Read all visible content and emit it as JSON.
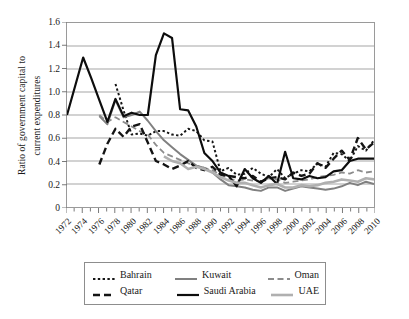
{
  "chart_data": {
    "type": "line",
    "title": "",
    "xlabel": "",
    "ylabel_line1": "Ratio of government capital to",
    "ylabel_line2": "current expenditures",
    "ylim": [
      0,
      1.6
    ],
    "ytick_labels": [
      "1.6",
      "1.4",
      "1.2",
      "1.0",
      "0.8",
      "0.6",
      "0.4",
      "0.2",
      "0"
    ],
    "ytick_values": [
      1.6,
      1.4,
      1.2,
      1.0,
      0.8,
      0.6,
      0.4,
      0.2,
      0
    ],
    "grid": true,
    "legend_position": "bottom",
    "xlim": [
      1972,
      2010
    ],
    "x": [
      1972,
      1973,
      1974,
      1975,
      1976,
      1977,
      1978,
      1979,
      1980,
      1981,
      1982,
      1983,
      1984,
      1985,
      1986,
      1987,
      1988,
      1989,
      1990,
      1991,
      1992,
      1993,
      1994,
      1995,
      1996,
      1997,
      1998,
      1999,
      2000,
      2001,
      2002,
      2003,
      2004,
      2005,
      2006,
      2007,
      2008,
      2009,
      2010
    ],
    "xtick_labels": [
      "1972",
      "1974",
      "1976",
      "1978",
      "1980",
      "1982",
      "1984",
      "1986",
      "1988",
      "1990",
      "1992",
      "1994",
      "1996",
      "1998",
      "2000",
      "2002",
      "2004",
      "2006",
      "2008",
      "2010"
    ],
    "xtick_values": [
      1972,
      1974,
      1976,
      1978,
      1980,
      1982,
      1984,
      1986,
      1988,
      1990,
      1992,
      1994,
      1996,
      1998,
      2000,
      2002,
      2004,
      2006,
      2008,
      2010
    ],
    "series": [
      {
        "name": "Bahrain",
        "style": "dotted",
        "color": "#161616",
        "width": 2.0,
        "dash": "2.4,2.4",
        "x": [
          1978,
          1979,
          1980,
          1981,
          1982,
          1983,
          1984,
          1985,
          1986,
          1987,
          1988,
          1989,
          1990,
          1991,
          1992,
          1993,
          1994,
          1995,
          1996,
          1997,
          1998,
          1999,
          2000,
          2001,
          2002,
          2003,
          2004,
          2005,
          2006,
          2007,
          2008,
          2009,
          2010
        ],
        "values": [
          1.07,
          0.84,
          0.63,
          0.64,
          0.62,
          0.66,
          0.66,
          0.63,
          0.62,
          0.68,
          0.66,
          0.58,
          0.57,
          0.31,
          0.34,
          0.28,
          0.29,
          0.34,
          0.29,
          0.26,
          0.33,
          0.25,
          0.29,
          0.32,
          0.31,
          0.38,
          0.35,
          0.47,
          0.46,
          0.4,
          0.53,
          0.49,
          0.58
        ]
      },
      {
        "name": "Kuwait",
        "style": "solid",
        "color": "#808080",
        "width": 2.0,
        "dash": "",
        "x": [
          1976,
          1977,
          1978,
          1979,
          1980,
          1981,
          1982,
          1983,
          1984,
          1985,
          1986,
          1987,
          1988,
          1989,
          1990,
          1991,
          1992,
          1993,
          1994,
          1995,
          1996,
          1997,
          1998,
          1999,
          2000,
          2001,
          2002,
          2003,
          2004,
          2005,
          2006,
          2007,
          2008,
          2009,
          2010
        ],
        "values": [
          0.79,
          0.72,
          0.93,
          0.78,
          0.8,
          0.83,
          0.75,
          0.66,
          0.58,
          0.52,
          0.46,
          0.41,
          0.36,
          0.34,
          0.3,
          0.24,
          0.19,
          0.18,
          0.17,
          0.15,
          0.14,
          0.17,
          0.17,
          0.14,
          0.16,
          0.18,
          0.17,
          0.16,
          0.15,
          0.16,
          0.18,
          0.21,
          0.19,
          0.22,
          0.2
        ]
      },
      {
        "name": "Oman",
        "style": "dashed",
        "color": "#8c8c8c",
        "width": 1.8,
        "dash": "6,3.5",
        "x": [
          1976,
          1977,
          1978,
          1979,
          1980,
          1981,
          1982,
          1983,
          1984,
          1985,
          1986,
          1987,
          1988,
          1989,
          1990,
          1991,
          1992,
          1993,
          1994,
          1995,
          1996,
          1997,
          1998,
          1999,
          2000,
          2001,
          2002,
          2003,
          2004,
          2005,
          2006,
          2007,
          2008,
          2009,
          2010
        ],
        "values": [
          0.8,
          0.74,
          0.78,
          0.74,
          0.7,
          0.66,
          0.63,
          0.54,
          0.47,
          0.44,
          0.41,
          0.38,
          0.36,
          0.34,
          0.32,
          0.28,
          0.25,
          0.23,
          0.24,
          0.23,
          0.22,
          0.25,
          0.24,
          0.21,
          0.22,
          0.23,
          0.24,
          0.26,
          0.27,
          0.28,
          0.3,
          0.29,
          0.32,
          0.3,
          0.31
        ]
      },
      {
        "name": "Qatar",
        "style": "dashed",
        "color": "#141414",
        "width": 2.4,
        "dash": "7,4",
        "x": [
          1976,
          1977,
          1978,
          1979,
          1980,
          1981,
          1982,
          1983,
          1984,
          1985,
          1986,
          1987,
          1988,
          1989,
          1990,
          1991,
          1992,
          1993,
          1994,
          1995,
          1996,
          1997,
          1998,
          1999,
          2000,
          2001,
          2002,
          2003,
          2004,
          2005,
          2006,
          2007,
          2008,
          2009,
          2010
        ],
        "values": [
          0.37,
          0.55,
          0.68,
          0.61,
          0.7,
          0.72,
          0.56,
          0.4,
          0.37,
          0.33,
          0.36,
          0.4,
          0.34,
          0.32,
          0.35,
          0.28,
          0.27,
          0.26,
          0.25,
          0.27,
          0.22,
          0.25,
          0.26,
          0.24,
          0.3,
          0.27,
          0.29,
          0.38,
          0.34,
          0.42,
          0.49,
          0.41,
          0.6,
          0.5,
          0.56
        ]
      },
      {
        "name": "Saudi Arabia",
        "style": "solid",
        "color": "#0d0d0d",
        "width": 2.2,
        "dash": "",
        "x": [
          1972,
          1973,
          1974,
          1975,
          1976,
          1977,
          1978,
          1979,
          1980,
          1981,
          1982,
          1983,
          1984,
          1985,
          1986,
          1987,
          1988,
          1989,
          1990,
          1991,
          1992,
          1993,
          1994,
          1995,
          1996,
          1997,
          1998,
          1999,
          2000,
          2001,
          2002,
          2003,
          2004,
          2005,
          2006,
          2007,
          2008,
          2009,
          2010
        ],
        "values": [
          0.8,
          1.05,
          1.3,
          1.12,
          0.93,
          0.74,
          0.94,
          0.79,
          0.82,
          0.8,
          0.8,
          1.32,
          1.51,
          1.47,
          0.85,
          0.84,
          0.7,
          0.47,
          0.4,
          0.3,
          0.27,
          0.18,
          0.33,
          0.25,
          0.21,
          0.27,
          0.2,
          0.48,
          0.25,
          0.24,
          0.27,
          0.25,
          0.26,
          0.31,
          0.32,
          0.4,
          0.42,
          0.42,
          0.42
        ]
      },
      {
        "name": "UAE",
        "style": "solid",
        "color": "#b0b0b0",
        "width": 2.6,
        "dash": "",
        "x": [
          1984,
          1985,
          1986,
          1987,
          1988,
          1989,
          1990,
          1991,
          1992,
          1993,
          1994,
          1995,
          1996,
          1997,
          1998,
          1999,
          2000,
          2001,
          2002,
          2003,
          2004,
          2005,
          2006,
          2007,
          2008,
          2009,
          2010
        ],
        "values": [
          0.44,
          0.4,
          0.38,
          0.33,
          0.35,
          0.33,
          0.3,
          0.26,
          0.23,
          0.21,
          0.21,
          0.19,
          0.17,
          0.19,
          0.2,
          0.17,
          0.17,
          0.19,
          0.18,
          0.19,
          0.21,
          0.22,
          0.24,
          0.23,
          0.22,
          0.25,
          0.24
        ]
      }
    ]
  },
  "legend": {
    "rows": [
      [
        {
          "label": "Bahrain",
          "swatch": "dotted-black"
        },
        {
          "label": "Kuwait",
          "swatch": "solid-gray"
        },
        {
          "label": "Oman",
          "swatch": "dashed-gray"
        }
      ],
      [
        {
          "label": "Qatar",
          "swatch": "dashed-black"
        },
        {
          "label": "Saudi Arabia",
          "swatch": "solid-black"
        },
        {
          "label": "UAE",
          "swatch": "solid-lightgray"
        }
      ]
    ]
  }
}
